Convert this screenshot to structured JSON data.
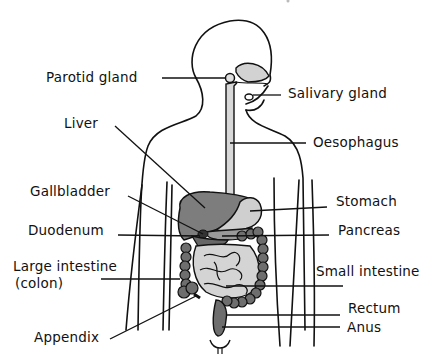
{
  "diagram": {
    "colors": {
      "outline": "#111111",
      "dark_organ": "#6e6e6e",
      "mid_organ": "#8a8a8a",
      "light_organ": "#d2d2d2",
      "background": "#ffffff"
    },
    "labels": {
      "parotid_gland": "Parotid gland",
      "salivary_gland": "Salivary gland",
      "liver": "Liver",
      "oesophagus": "Oesophagus",
      "gallbladder": "Gallbladder",
      "stomach": "Stomach",
      "duodenum": "Duodenum",
      "pancreas": "Pancreas",
      "large_intestine": "Large intestine",
      "colon": "(colon)",
      "small_intestine": "Small intestine",
      "rectum": "Rectum",
      "anus": "Anus",
      "appendix": "Appendix"
    }
  }
}
